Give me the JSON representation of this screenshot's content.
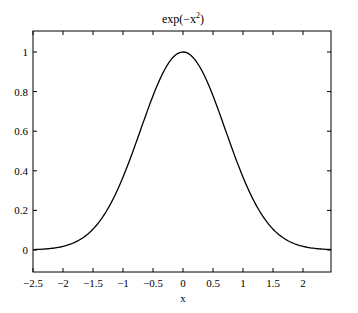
{
  "chart_data": {
    "type": "line",
    "title_base": "exp(−x",
    "title_sup": "2",
    "title_end": ")",
    "xlabel": "x",
    "ylabel": "",
    "xlim": [
      -2.5,
      2.47
    ],
    "ylim": [
      -0.1,
      1.1
    ],
    "x_ticks": [
      -2.5,
      -2,
      -1.5,
      -1,
      -0.5,
      0,
      0.5,
      1,
      1.5,
      2
    ],
    "x_tick_labels": [
      "−2.5",
      "−2",
      "−1.5",
      "−1",
      "−0.5",
      "0",
      "0.5",
      "1",
      "1.5",
      "2"
    ],
    "y_ticks": [
      0,
      0.2,
      0.4,
      0.6,
      0.8,
      1
    ],
    "y_tick_labels": [
      "0",
      "0.2",
      "0.4",
      "0.6",
      "0.8",
      "1"
    ],
    "grid": false,
    "legend": null,
    "series": [
      {
        "name": "exp(-x^2)",
        "color": "#000000",
        "x": [
          -2.5,
          -2.25,
          -2.0,
          -1.75,
          -1.5,
          -1.25,
          -1.0,
          -0.75,
          -0.5,
          -0.25,
          0.0,
          0.25,
          0.5,
          0.75,
          1.0,
          1.25,
          1.5,
          1.75,
          2.0,
          2.25,
          2.47
        ],
        "y": [
          0.002,
          0.006,
          0.018,
          0.047,
          0.105,
          0.21,
          0.368,
          0.57,
          0.779,
          0.939,
          1.0,
          0.939,
          0.779,
          0.57,
          0.368,
          0.21,
          0.105,
          0.047,
          0.018,
          0.006,
          0.002
        ]
      }
    ]
  }
}
